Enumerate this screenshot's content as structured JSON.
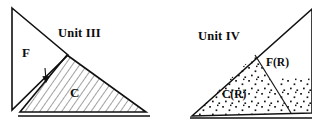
{
  "figure": {
    "panels": [
      {
        "id": "unit-3",
        "title": "Unit III",
        "regions": [
          {
            "id": "f-region",
            "label": "F",
            "fill": "plain"
          },
          {
            "id": "c-region",
            "label": "C",
            "fill": "hatched"
          }
        ],
        "annotations": [
          {
            "id": "flow-arrow",
            "label": "",
            "shape": "down-arrow"
          }
        ]
      },
      {
        "id": "unit-4",
        "title": "Unit IV",
        "regions": [
          {
            "id": "fr-region",
            "label": "F(R)",
            "fill": "plain"
          },
          {
            "id": "cr-region",
            "label": "C(R)",
            "fill": "stippled"
          }
        ],
        "annotations": []
      }
    ],
    "colors": {
      "ink": "#111111",
      "background": "#ffffff",
      "hatch": "#555555",
      "stipple": "#1a1a1a"
    }
  }
}
